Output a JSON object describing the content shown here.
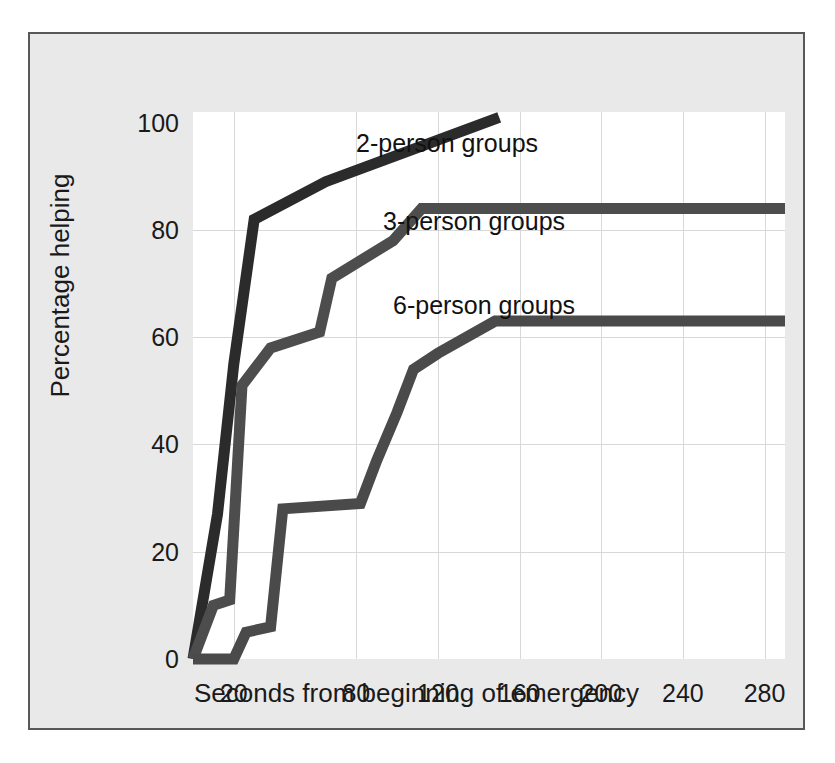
{
  "chart_data": {
    "type": "line",
    "title": "",
    "xlabel": "Seconds from beginning of emergency",
    "ylabel": "Percentage helping",
    "xticks": [
      "20",
      "80",
      "120",
      "160",
      "200",
      "240",
      "280"
    ],
    "xtick_values": [
      20,
      80,
      120,
      160,
      200,
      240,
      280
    ],
    "yticks": [
      "0",
      "20",
      "40",
      "60",
      "80",
      "100"
    ],
    "ytick_values": [
      0,
      20,
      40,
      60,
      80,
      100
    ],
    "xlim": [
      0,
      290
    ],
    "ylim": [
      0,
      102
    ],
    "grid": true,
    "legend_position": "inline-annotations",
    "series": [
      {
        "name": "2-person groups",
        "color": "#2b2b2b",
        "label_x": 163,
        "label_y": 17,
        "points": [
          {
            "x": 0,
            "y": 0
          },
          {
            "x": 12,
            "y": 27
          },
          {
            "x": 20,
            "y": 55
          },
          {
            "x": 30,
            "y": 82
          },
          {
            "x": 65,
            "y": 89
          },
          {
            "x": 150,
            "y": 101
          }
        ]
      },
      {
        "name": "3-person groups",
        "color": "#4d4d4d",
        "label_x": 190,
        "label_y": 95,
        "points": [
          {
            "x": 0,
            "y": 0
          },
          {
            "x": 10,
            "y": 10
          },
          {
            "x": 18,
            "y": 11
          },
          {
            "x": 24,
            "y": 51
          },
          {
            "x": 38,
            "y": 58
          },
          {
            "x": 62,
            "y": 61
          },
          {
            "x": 68,
            "y": 71
          },
          {
            "x": 98,
            "y": 78
          },
          {
            "x": 112,
            "y": 84
          },
          {
            "x": 290,
            "y": 84
          }
        ]
      },
      {
        "name": "6-person groups",
        "color": "#4a4a4a",
        "label_x": 200,
        "label_y": 179,
        "points": [
          {
            "x": 0,
            "y": 0
          },
          {
            "x": 20,
            "y": 0
          },
          {
            "x": 26,
            "y": 5
          },
          {
            "x": 38,
            "y": 6
          },
          {
            "x": 44,
            "y": 28
          },
          {
            "x": 82,
            "y": 29
          },
          {
            "x": 90,
            "y": 37
          },
          {
            "x": 100,
            "y": 46
          },
          {
            "x": 108,
            "y": 54
          },
          {
            "x": 120,
            "y": 57
          },
          {
            "x": 148,
            "y": 63
          },
          {
            "x": 290,
            "y": 63
          }
        ]
      }
    ]
  },
  "colors": {
    "page_background": "#ffffff",
    "frame_background": "#e9e9e9",
    "frame_border": "#58585a",
    "plot_background": "#ffffff",
    "gridline": "#d8d8d8",
    "text": "#1a1a1a"
  }
}
